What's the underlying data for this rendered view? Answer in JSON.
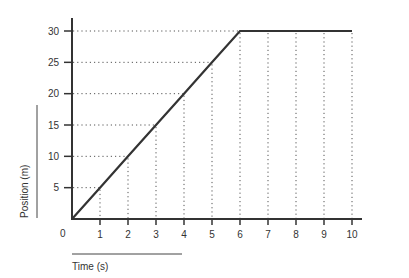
{
  "chart_data": {
    "type": "line",
    "title": "",
    "xlabel": "Time (s)",
    "ylabel": "Position (m)",
    "x": [
      0,
      1,
      2,
      3,
      4,
      5,
      6,
      7,
      8,
      9,
      10
    ],
    "series": [
      {
        "name": "Position",
        "values": [
          0,
          5,
          10,
          15,
          20,
          25,
          30,
          30,
          30,
          30,
          30
        ]
      }
    ],
    "xlim": [
      0,
      10
    ],
    "ylim": [
      0,
      30
    ],
    "x_ticks": [
      "1",
      "2",
      "3",
      "4",
      "5",
      "6",
      "7",
      "8",
      "9",
      "10"
    ],
    "y_ticks": [
      "5",
      "10",
      "15",
      "20",
      "25",
      "30"
    ],
    "origin_label": "0",
    "grid": "dotted drop-lines from data points to axes",
    "line_color": "#333333",
    "grid_color": "#555555"
  }
}
